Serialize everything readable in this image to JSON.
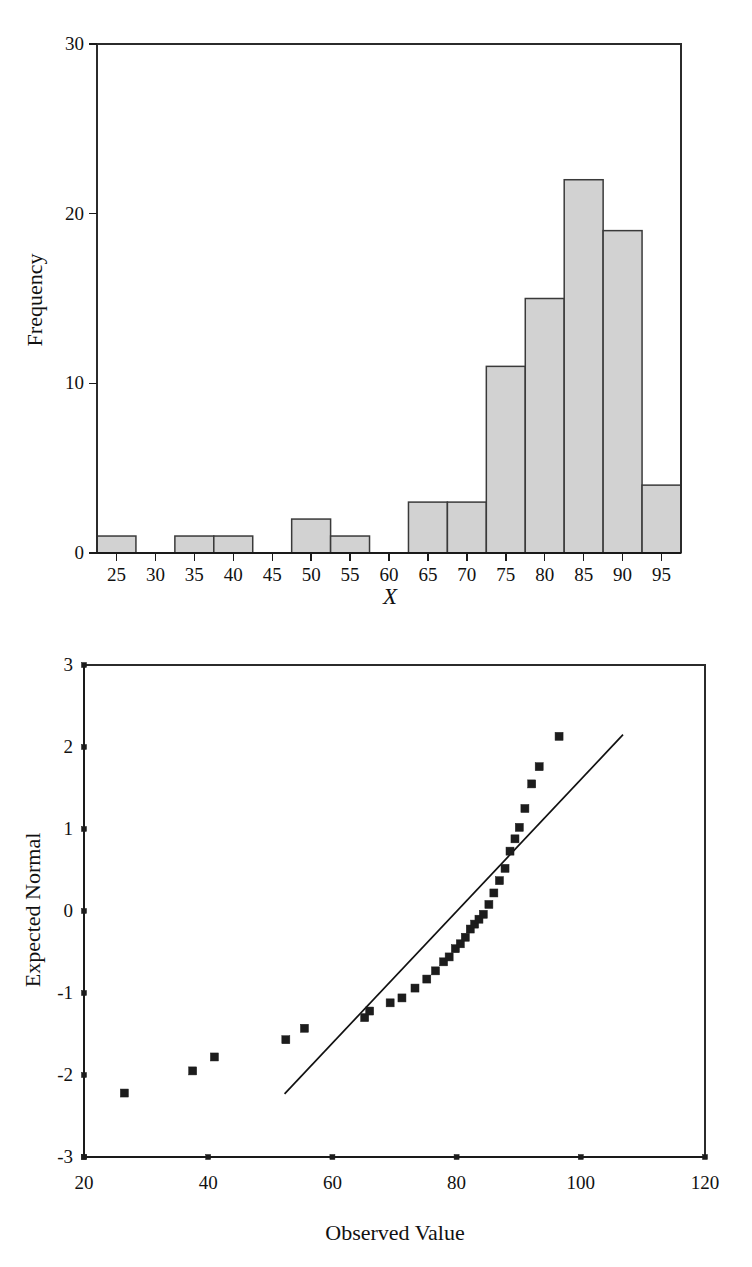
{
  "page": {
    "background": "#ffffff",
    "width": 752,
    "height": 1267
  },
  "figures": [
    {
      "id": "histogram",
      "name": "histogram-of-x"
    },
    {
      "id": "qqplot",
      "name": "normal-q-q-plot"
    }
  ],
  "chart_data": [
    {
      "type": "bar",
      "name": "histogram",
      "title": "",
      "xlabel": "X",
      "ylabel": "Frequency",
      "xlim": [
        22.5,
        97.5
      ],
      "ylim": [
        0,
        30
      ],
      "grid": false,
      "legend": null,
      "bin_width": 5,
      "xticks": [
        25,
        30,
        35,
        40,
        45,
        50,
        55,
        60,
        65,
        70,
        75,
        80,
        85,
        90,
        95
      ],
      "xticklabels": [
        "25",
        "30",
        "35",
        "40",
        "45",
        "50",
        "55",
        "60",
        "65",
        "70",
        "75",
        "80",
        "85",
        "90",
        "95"
      ],
      "yticks": [
        0,
        10,
        20,
        30
      ],
      "yticklabels": [
        "0",
        "10",
        "20",
        "30"
      ],
      "categories": [
        "25",
        "30",
        "35",
        "40",
        "45",
        "50",
        "55",
        "60",
        "65",
        "70",
        "75",
        "80",
        "85",
        "90",
        "95"
      ],
      "bin_centers": [
        25,
        30,
        35,
        40,
        45,
        50,
        55,
        60,
        65,
        70,
        75,
        80,
        85,
        90,
        95
      ],
      "values": [
        1,
        0,
        1,
        1,
        0,
        2,
        1,
        0,
        3,
        3,
        11,
        15,
        22,
        19,
        4
      ],
      "fill_color": "#d2d2d2",
      "edge_color": "#3a3a3a"
    },
    {
      "type": "scatter",
      "name": "qq-plot",
      "title": "",
      "xlabel": "Observed Value",
      "ylabel": "Expected Normal",
      "xlim": [
        20,
        120
      ],
      "ylim": [
        -3,
        3
      ],
      "grid": false,
      "legend": null,
      "xticks": [
        20,
        40,
        60,
        80,
        100,
        120
      ],
      "xticklabels": [
        "20",
        "40",
        "60",
        "80",
        "100",
        "120"
      ],
      "yticks": [
        -3,
        -2,
        -1,
        0,
        1,
        2,
        3
      ],
      "yticklabels": [
        "-3",
        "-2",
        "-1",
        "0",
        "1",
        "2",
        "3"
      ],
      "x": [
        26.5,
        37.5,
        41.0,
        52.5,
        55.5,
        65.2,
        66.0,
        69.3,
        71.2,
        73.3,
        75.2,
        77.0,
        78.0,
        79.0,
        80.0,
        80.8,
        81.6,
        82.4,
        83.2,
        84.0,
        85.0,
        86.0,
        87.3,
        88.3,
        89.2,
        90.2,
        91.5,
        93.3,
        96.5
      ],
      "y": [
        -2.22,
        -1.95,
        -1.78,
        -1.57,
        -1.43,
        -1.3,
        -1.22,
        -1.12,
        -1.06,
        -0.94,
        -0.83,
        -0.73,
        -0.62,
        -0.56,
        -0.46,
        -0.4,
        -0.32,
        -0.22,
        -0.16,
        -0.1,
        -0.04,
        0.08,
        0.22,
        0.37,
        0.52,
        0.73,
        0.88,
        1.02,
        1.25,
        1.55,
        1.76,
        2.13
      ],
      "series": [
        {
          "name": "data-points",
          "points": [
            [
              26.5,
              -2.22
            ],
            [
              37.5,
              -1.95
            ],
            [
              41.0,
              -1.78
            ],
            [
              52.5,
              -1.57
            ],
            [
              55.5,
              -1.43
            ],
            [
              65.2,
              -1.3
            ],
            [
              66.0,
              -1.22
            ],
            [
              69.3,
              -1.12
            ],
            [
              71.2,
              -1.06
            ],
            [
              73.3,
              -0.94
            ],
            [
              75.2,
              -0.83
            ],
            [
              76.6,
              -0.73
            ],
            [
              77.9,
              -0.62
            ],
            [
              78.8,
              -0.56
            ],
            [
              79.8,
              -0.46
            ],
            [
              80.6,
              -0.4
            ],
            [
              81.4,
              -0.32
            ],
            [
              82.2,
              -0.22
            ],
            [
              82.9,
              -0.16
            ],
            [
              83.6,
              -0.1
            ],
            [
              84.3,
              -0.04
            ],
            [
              85.2,
              0.08
            ],
            [
              86.0,
              0.22
            ],
            [
              86.9,
              0.37
            ],
            [
              87.8,
              0.52
            ],
            [
              88.6,
              0.73
            ],
            [
              89.4,
              0.88
            ],
            [
              90.1,
              1.02
            ],
            [
              91.0,
              1.25
            ],
            [
              92.1,
              1.55
            ],
            [
              93.3,
              1.76
            ],
            [
              96.5,
              2.13
            ]
          ]
        }
      ],
      "reference_line": {
        "x1": 52.3,
        "y1": -2.23,
        "x2": 106.8,
        "y2": 2.15
      },
      "marker": "square",
      "marker_color": "#1c1c1c"
    }
  ]
}
